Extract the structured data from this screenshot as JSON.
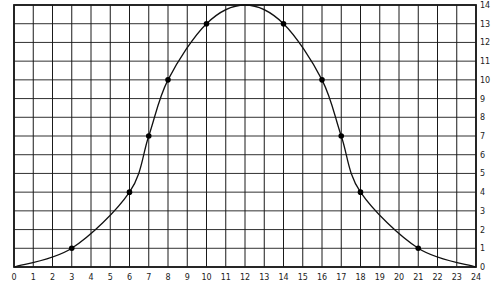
{
  "chart_data": {
    "type": "line",
    "title": "",
    "xlabel": "",
    "ylabel": "",
    "xlim": [
      0,
      24
    ],
    "ylim": [
      0,
      14
    ],
    "grid": true,
    "legend": null,
    "x_ticks": [
      0,
      1,
      2,
      3,
      4,
      5,
      6,
      7,
      8,
      9,
      10,
      11,
      12,
      13,
      14,
      15,
      16,
      17,
      18,
      19,
      20,
      21,
      22,
      23,
      24
    ],
    "y_ticks": [
      0,
      1,
      2,
      3,
      4,
      5,
      6,
      7,
      8,
      9,
      10,
      11,
      12,
      13,
      14
    ],
    "y_axis_position": "right",
    "series": [
      {
        "name": "curve",
        "marked_points": [
          {
            "x": 3,
            "y": 1
          },
          {
            "x": 6,
            "y": 4
          },
          {
            "x": 7,
            "y": 7
          },
          {
            "x": 8,
            "y": 10
          },
          {
            "x": 10,
            "y": 13
          },
          {
            "x": 14,
            "y": 13
          },
          {
            "x": 16,
            "y": 10
          },
          {
            "x": 17,
            "y": 7
          },
          {
            "x": 18,
            "y": 4
          },
          {
            "x": 21,
            "y": 1
          }
        ],
        "curve_points": [
          {
            "x": 0,
            "y": 0
          },
          {
            "x": 3,
            "y": 1
          },
          {
            "x": 6,
            "y": 4
          },
          {
            "x": 7,
            "y": 7
          },
          {
            "x": 8,
            "y": 10
          },
          {
            "x": 10,
            "y": 13
          },
          {
            "x": 12,
            "y": 14
          },
          {
            "x": 14,
            "y": 13
          },
          {
            "x": 16,
            "y": 10
          },
          {
            "x": 17,
            "y": 7
          },
          {
            "x": 18,
            "y": 4
          },
          {
            "x": 21,
            "y": 1
          },
          {
            "x": 24,
            "y": 0
          }
        ]
      }
    ]
  },
  "colors": {
    "grid": "#1a1a1a",
    "line": "#111111",
    "marker": "#000000",
    "background": "#ffffff"
  }
}
